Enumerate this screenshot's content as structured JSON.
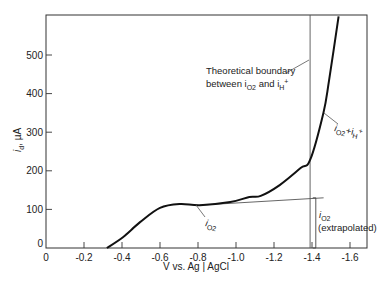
{
  "chart_data": {
    "type": "line",
    "title": "",
    "xlabel": "V vs. Ag | AgCl",
    "ylabel": "i_d, µA",
    "xlim": [
      0,
      -1.7
    ],
    "ylim": [
      0,
      600
    ],
    "grid": false,
    "x_ticks": [
      "0",
      "-0.2",
      "-0.4",
      "-0.6",
      "-0.8",
      "-1.0",
      "-1.2",
      "-1.4",
      "-1.6"
    ],
    "y_ticks": [
      "0",
      "100",
      "200",
      "300",
      "400",
      "500"
    ],
    "series": [
      {
        "name": "i_d",
        "x": [
          -0.32,
          -0.405,
          -0.495,
          -0.6,
          -0.705,
          -0.81,
          -0.97,
          -1.07,
          -1.13,
          -1.23,
          -1.34,
          -1.39,
          -1.46,
          -1.49,
          -1.54
        ],
        "values": [
          0,
          28,
          67,
          104,
          114,
          111,
          119,
          132,
          135,
          163,
          207,
          228,
          350,
          435,
          600
        ]
      },
      {
        "name": "i_O2 (extrapolated)",
        "style": "thin",
        "x": [
          -0.81,
          -1.44
        ],
        "values": [
          111,
          130
        ]
      }
    ],
    "annotations": [
      {
        "text": "Theoretical boundary between i_O2 and i_H+",
        "type": "vertical_line",
        "x": -1.39
      },
      {
        "text": "i_O2 + i_H+",
        "target": "steep rise region"
      },
      {
        "text": "i_O2",
        "target": "plateau region"
      },
      {
        "text": "i_O2 (extrapolated)",
        "target": "bracket at x=-1.42 from 0 to 130"
      }
    ]
  },
  "labels": {
    "y_axis_title_main": "i",
    "y_axis_title_sub": "d",
    "y_axis_title_unit": ", µA",
    "x_axis_title": "V vs. Ag | AgCl",
    "boundary_line1": "Theoretical boundary",
    "boundary_line2_a": "between i",
    "boundary_line2_sub": "O2",
    "boundary_line2_b": " and i",
    "boundary_line2_sub2": "H",
    "boundary_line2_sup": "+",
    "sum_label_a": "i",
    "sum_label_sub": "O2",
    "sum_label_b": "+i",
    "sum_label_sub2": "H",
    "sum_label_sup": "+",
    "io2_label": "i",
    "io2_sub": "O2",
    "extrap_label_a": "i",
    "extrap_label_sub": "O2",
    "extrap_label_b": "(extrapolated)"
  }
}
